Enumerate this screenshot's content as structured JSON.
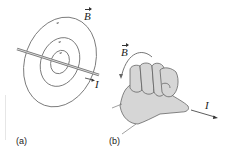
{
  "figure": {
    "panels": [
      {
        "id": "a",
        "caption": "(a)",
        "description": "Straight current-carrying wire with concentric circular magnetic field lines",
        "field_label": "B",
        "current_label": "I",
        "field_line_count": 3
      },
      {
        "id": "b",
        "caption": "(b)",
        "description": "Right-hand rule: thumb points along current, curled fingers show field direction",
        "field_label": "B",
        "current_label": "I"
      }
    ],
    "colors": {
      "line": "#7a7a7a",
      "wire": "#888888",
      "hand_fill": "#d6d6d6",
      "hand_outline": "#555555",
      "text": "#222222"
    }
  }
}
